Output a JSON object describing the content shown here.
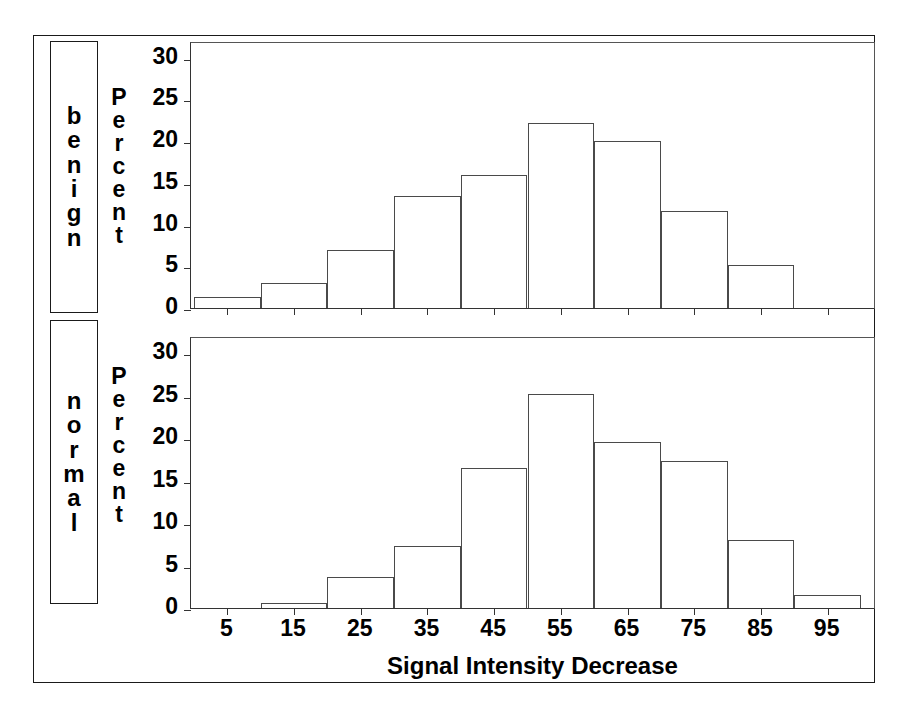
{
  "figure": {
    "xaxis_title": "Signal Intensity Decrease",
    "panel_labels": [
      "benign",
      "normal"
    ],
    "ylabel": "Percent"
  },
  "chart_data": {
    "type": "bar",
    "title": "",
    "subtitle": "",
    "xlabel": "Signal Intensity Decrease",
    "ylabel": "Percent",
    "xlim": [
      0,
      100
    ],
    "ylim": [
      0,
      32
    ],
    "yticks": [
      0,
      5,
      10,
      15,
      20,
      25,
      30
    ],
    "xticks": [
      5,
      15,
      25,
      35,
      45,
      55,
      65,
      75,
      85,
      95
    ],
    "grid": false,
    "legend": "none",
    "bin_width": 10,
    "categories": [
      "5",
      "15",
      "25",
      "35",
      "45",
      "55",
      "65",
      "75",
      "85",
      "95"
    ],
    "panels": [
      {
        "name": "benign",
        "ylabel": "Percent",
        "values": [
          1.3,
          3.0,
          7.0,
          13.4,
          16.0,
          22.2,
          20.0,
          11.6,
          5.2,
          0.0
        ]
      },
      {
        "name": "normal",
        "ylabel": "Percent",
        "values": [
          0.0,
          0.6,
          3.6,
          7.3,
          16.5,
          25.2,
          19.5,
          17.3,
          8.0,
          1.5
        ]
      }
    ],
    "series": [
      {
        "name": "benign",
        "values": [
          1.3,
          3.0,
          7.0,
          13.4,
          16.0,
          22.2,
          20.0,
          11.6,
          5.2,
          0.0
        ]
      },
      {
        "name": "normal",
        "values": [
          0.0,
          0.6,
          3.6,
          7.3,
          16.5,
          25.2,
          19.5,
          17.3,
          8.0,
          1.5
        ]
      }
    ],
    "colors": {
      "bar_fill": "#ffffff",
      "bar_stroke": "#4a4a4a",
      "axis": "#1a1a1a",
      "text": "#000000"
    }
  }
}
